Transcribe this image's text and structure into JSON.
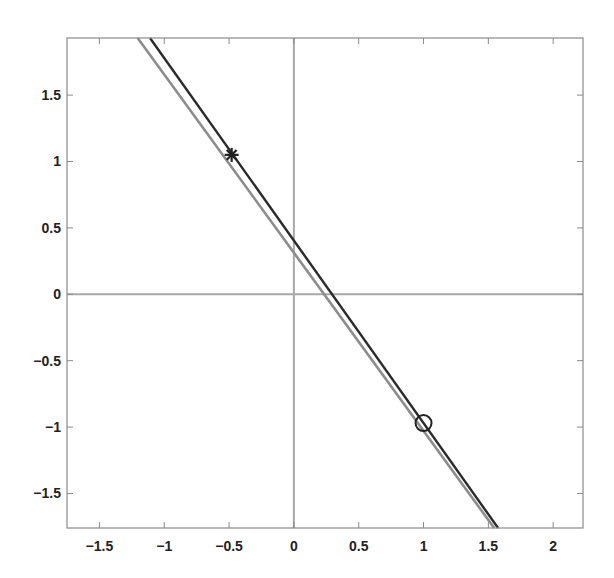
{
  "chart_data": {
    "type": "line",
    "title": "",
    "xlabel": "",
    "ylabel": "",
    "xlim": [
      -1.75,
      2.23
    ],
    "ylim": [
      -1.76,
      1.93
    ],
    "grid": false,
    "legend": null,
    "x_ticks": [
      -1.5,
      -1,
      -0.5,
      0,
      0.5,
      1,
      1.5,
      2
    ],
    "x_tick_labels": [
      "−1.5",
      "−1",
      "−0.5",
      "0",
      "0.5",
      "1",
      "1.5",
      "2"
    ],
    "y_ticks": [
      1.5,
      1,
      0.5,
      0,
      -0.5,
      -1,
      -1.5
    ],
    "y_tick_labels": [
      "1.5",
      "1",
      "0.5",
      "0",
      "−0.5",
      "−1",
      "−1.5"
    ],
    "reference_lines": [
      {
        "name": "x-axis (y=0)",
        "orientation": "horizontal",
        "value": 0,
        "color": "#a8a8a8"
      },
      {
        "name": "y-axis (x=0)",
        "orientation": "vertical",
        "value": 0,
        "color": "#a8a8a8"
      }
    ],
    "series": [
      {
        "name": "dark line",
        "color": "#2a2a2a",
        "x": [
          -1.11,
          1.575
        ],
        "y": [
          1.93,
          -1.76
        ],
        "slope": -1.375,
        "intercept": 0.4
      },
      {
        "name": "gray line",
        "color": "#8c8c8c",
        "x": [
          -1.205,
          1.545
        ],
        "y": [
          1.93,
          -1.76
        ],
        "slope": -1.34,
        "intercept": 0.33
      }
    ],
    "markers": [
      {
        "name": "star",
        "symbol": "*",
        "x": -0.48,
        "y": 1.05,
        "color": "#222222"
      },
      {
        "name": "circle",
        "symbol": "o",
        "x": 1.0,
        "y": -0.97,
        "color": "#222222"
      }
    ]
  }
}
